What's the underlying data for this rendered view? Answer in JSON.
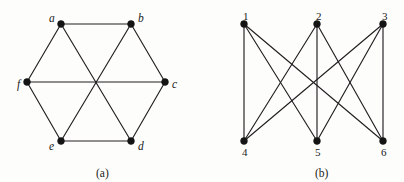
{
  "figure": {
    "background_color": "#fdfdfc",
    "ink_color": "#231f20",
    "vertex_color": "#141414",
    "width": 404,
    "height": 182
  },
  "panels": [
    {
      "id": "panel-a",
      "caption": "(a)",
      "caption_x": 96,
      "caption_y": 168,
      "description": "hexagonal drawing of K3,3",
      "vertices": [
        {
          "id": "a",
          "label": "a",
          "x": 61,
          "y": 24,
          "label_dx": -12,
          "label_dy": -11
        },
        {
          "id": "b",
          "label": "b",
          "x": 131,
          "y": 24,
          "label_dx": 7,
          "label_dy": -11
        },
        {
          "id": "c",
          "label": "c",
          "x": 165,
          "y": 82,
          "label_dx": 7,
          "label_dy": -3
        },
        {
          "id": "d",
          "label": "d",
          "x": 131,
          "y": 141,
          "label_dx": 7,
          "label_dy": 0
        },
        {
          "id": "e",
          "label": "e",
          "x": 61,
          "y": 141,
          "label_dx": -12,
          "label_dy": 0
        },
        {
          "id": "f",
          "label": "f",
          "x": 27,
          "y": 82,
          "label_dx": -10,
          "label_dy": -3
        }
      ],
      "edges": [
        [
          "a",
          "b"
        ],
        [
          "b",
          "c"
        ],
        [
          "c",
          "d"
        ],
        [
          "d",
          "e"
        ],
        [
          "e",
          "f"
        ],
        [
          "f",
          "a"
        ],
        [
          "a",
          "d"
        ],
        [
          "b",
          "e"
        ],
        [
          "c",
          "f"
        ]
      ]
    },
    {
      "id": "panel-b",
      "caption": "(b)",
      "caption_x": 315,
      "caption_y": 168,
      "description": "bipartite drawing of K3,3",
      "vertices": [
        {
          "id": "1",
          "label": "1",
          "x": 244,
          "y": 24,
          "label_dx": -1,
          "label_dy": -13
        },
        {
          "id": "2",
          "label": "2",
          "x": 317,
          "y": 24,
          "label_dx": -1,
          "label_dy": -13
        },
        {
          "id": "3",
          "label": "3",
          "x": 383,
          "y": 24,
          "label_dx": -1,
          "label_dy": -13
        },
        {
          "id": "4",
          "label": "4",
          "x": 244,
          "y": 141,
          "label_dx": -2,
          "label_dy": 6
        },
        {
          "id": "5",
          "label": "5",
          "x": 317,
          "y": 141,
          "label_dx": -2,
          "label_dy": 6
        },
        {
          "id": "6",
          "label": "6",
          "x": 383,
          "y": 141,
          "label_dx": -2,
          "label_dy": 6
        }
      ],
      "edges": [
        [
          "1",
          "4"
        ],
        [
          "1",
          "5"
        ],
        [
          "1",
          "6"
        ],
        [
          "2",
          "4"
        ],
        [
          "2",
          "5"
        ],
        [
          "2",
          "6"
        ],
        [
          "3",
          "4"
        ],
        [
          "3",
          "5"
        ],
        [
          "3",
          "6"
        ]
      ]
    }
  ]
}
